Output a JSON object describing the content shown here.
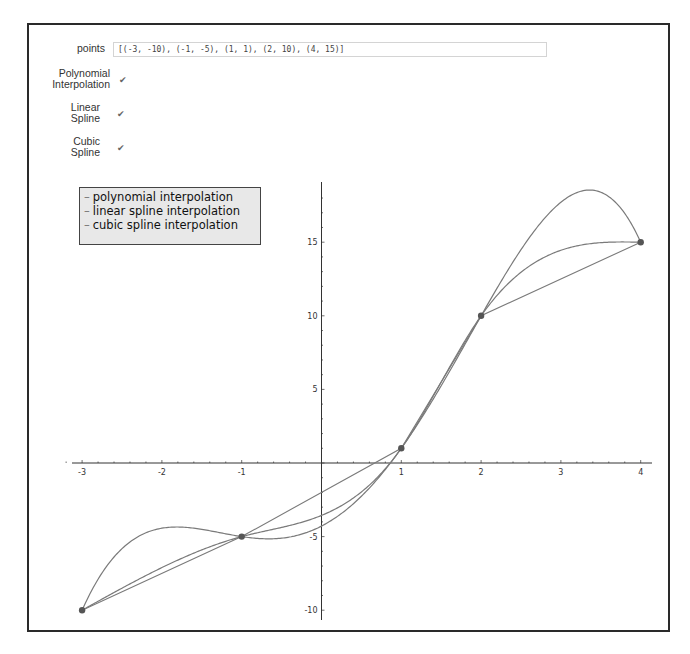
{
  "controls": {
    "points_label": "points",
    "points_value": "[(-3, -10), (-1, -5), (1, 1), (2, 10), (4, 15)]",
    "checkboxes": [
      {
        "label_line1": "Polynomial",
        "label_line2": "Interpolation",
        "checked": true
      },
      {
        "label_line1": "Linear",
        "label_line2": "Spline",
        "checked": true
      },
      {
        "label_line1": "Cubic",
        "label_line2": "Spline",
        "checked": true
      }
    ]
  },
  "legend": {
    "items": [
      {
        "label": "polynomial interpolation"
      },
      {
        "label": "linear spline interpolation"
      },
      {
        "label": "cubic spline interpolation"
      }
    ]
  },
  "colors": {
    "curve": "#7a7a7a",
    "point": "#555555",
    "axis": "#333333",
    "legend_bg": "#e8e8e8"
  },
  "chart_data": {
    "type": "line",
    "title": "",
    "xlabel": "",
    "ylabel": "",
    "xlim": [
      -3,
      4
    ],
    "ylim": [
      -10.5,
      19
    ],
    "x_ticks": [
      -3,
      -2,
      -1,
      1,
      2,
      3,
      4
    ],
    "y_ticks": [
      -10,
      -5,
      5,
      10,
      15
    ],
    "grid": false,
    "legend_position": "upper left",
    "points": [
      [
        -3,
        -10
      ],
      [
        -1,
        -5
      ],
      [
        1,
        1
      ],
      [
        2,
        10
      ],
      [
        4,
        15
      ]
    ],
    "series": [
      {
        "name": "polynomial interpolation",
        "method": "lagrange-degree-4"
      },
      {
        "name": "linear spline interpolation",
        "method": "piecewise-linear"
      },
      {
        "name": "cubic spline interpolation",
        "method": "natural-cubic-spline"
      }
    ]
  }
}
